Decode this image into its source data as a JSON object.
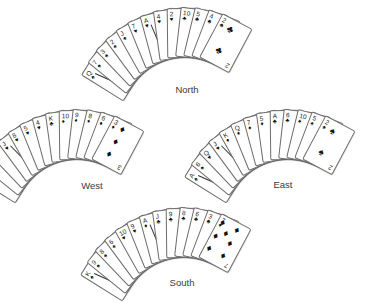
{
  "diagram": {
    "card_back_color": "#ffffff",
    "card_border_color": "#6e6e6e",
    "label_color": "#3a3a3a"
  },
  "hands": {
    "north": {
      "label": "North",
      "cards": [
        {
          "rank": "Q",
          "suit": "♠"
        },
        {
          "rank": "7",
          "suit": "♠"
        },
        {
          "rank": "3",
          "suit": "♠"
        },
        {
          "rank": "2",
          "suit": "♠"
        },
        {
          "rank": "J",
          "suit": "♠"
        },
        {
          "rank": "7",
          "suit": "♥"
        },
        {
          "rank": "A",
          "suit": "♥"
        },
        {
          "rank": "4",
          "suit": "♥"
        },
        {
          "rank": "2",
          "suit": "♥"
        },
        {
          "rank": "10",
          "suit": "♣"
        },
        {
          "rank": "5",
          "suit": "♣"
        },
        {
          "rank": "4",
          "suit": "♣"
        },
        {
          "rank": "2",
          "suit": "♣"
        }
      ],
      "front_pips": 2,
      "front_suit": "♣"
    },
    "west": {
      "label": "West",
      "cards": [
        {
          "rank": "4",
          "suit": "♠"
        },
        {
          "rank": "3",
          "suit": "♠"
        },
        {
          "rank": "K",
          "suit": "♥"
        },
        {
          "rank": "J",
          "suit": "♥"
        },
        {
          "rank": "8",
          "suit": "♥"
        },
        {
          "rank": "5",
          "suit": "♥"
        },
        {
          "rank": "4",
          "suit": "♥"
        },
        {
          "rank": "K",
          "suit": "♣"
        },
        {
          "rank": "10",
          "suit": "♦"
        },
        {
          "rank": "9",
          "suit": "♦"
        },
        {
          "rank": "8",
          "suit": "♦"
        },
        {
          "rank": "6",
          "suit": "♦"
        },
        {
          "rank": "3",
          "suit": "♦"
        }
      ],
      "front_pips": 3,
      "front_suit": "♦"
    },
    "east": {
      "label": "East",
      "cards": [
        {
          "rank": "A",
          "suit": "♠"
        },
        {
          "rank": "6",
          "suit": "♠"
        },
        {
          "rank": "Q",
          "suit": "♥"
        },
        {
          "rank": "J",
          "suit": "♥"
        },
        {
          "rank": "K",
          "suit": "♦"
        },
        {
          "rank": "Q",
          "suit": "♦"
        },
        {
          "rank": "7",
          "suit": "♦"
        },
        {
          "rank": "5",
          "suit": "♦"
        },
        {
          "rank": "A",
          "suit": "♣"
        },
        {
          "rank": "6",
          "suit": "♣"
        },
        {
          "rank": "10",
          "suit": "♠"
        },
        {
          "rank": "5",
          "suit": "♠"
        },
        {
          "rank": "2",
          "suit": "♠"
        }
      ],
      "front_pips": 2,
      "front_suit": "♠"
    },
    "south": {
      "label": "South",
      "cards": [
        {
          "rank": "K",
          "suit": "♠"
        },
        {
          "rank": "9",
          "suit": "♠"
        },
        {
          "rank": "8",
          "suit": "♠"
        },
        {
          "rank": "6",
          "suit": "♠"
        },
        {
          "rank": "10",
          "suit": "♥"
        },
        {
          "rank": "9",
          "suit": "♥"
        },
        {
          "rank": "A",
          "suit": "♦"
        },
        {
          "rank": "J",
          "suit": "♣"
        },
        {
          "rank": "9",
          "suit": "♣"
        },
        {
          "rank": "8",
          "suit": "♣"
        },
        {
          "rank": "6",
          "suit": "♣"
        },
        {
          "rank": "3",
          "suit": "♣"
        },
        {
          "rank": "7",
          "suit": "♦"
        }
      ],
      "front_pips": 7,
      "front_suit": "♦"
    }
  }
}
